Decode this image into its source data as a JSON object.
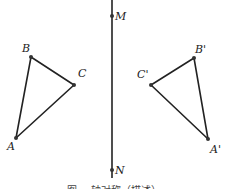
{
  "diagram": {
    "type": "geometry-reflection",
    "axis": {
      "name": "MN",
      "x": 112,
      "y_top": 0,
      "y_bottom": 178,
      "points": [
        {
          "label": "M",
          "x": 112,
          "y": 16
        },
        {
          "label": "N",
          "x": 112,
          "y": 170
        }
      ]
    },
    "triangle_original": {
      "name": "ABC",
      "vertices": [
        {
          "label": "A",
          "x": 16,
          "y": 138,
          "label_dx": -9,
          "label_dy": 12
        },
        {
          "label": "B",
          "x": 31,
          "y": 57,
          "label_dx": -9,
          "label_dy": -5
        },
        {
          "label": "C",
          "x": 74,
          "y": 85,
          "label_dx": 4,
          "label_dy": -8
        }
      ]
    },
    "triangle_reflected": {
      "name": "A'B'C'",
      "vertices": [
        {
          "label": "A'",
          "x": 208,
          "y": 139,
          "label_dx": 2,
          "label_dy": 14
        },
        {
          "label": "B'",
          "x": 194,
          "y": 58,
          "label_dx": 1,
          "label_dy": -5
        },
        {
          "label": "C'",
          "x": 151,
          "y": 85,
          "label_dx": -14,
          "label_dy": -7
        }
      ]
    },
    "caption": "图— 轴对称（描述）",
    "colors": {
      "line": "#222222",
      "point": "#333333",
      "background": "#ffffff"
    }
  }
}
